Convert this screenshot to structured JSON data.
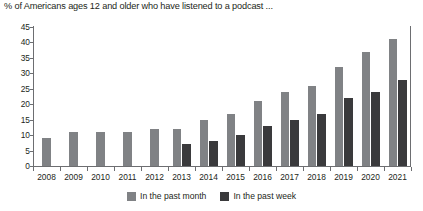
{
  "chart_data": {
    "type": "bar",
    "title": "% of Americans ages 12 and older who have listened to a podcast ...",
    "xlabel": "",
    "ylabel": "",
    "ylim": [
      0,
      45
    ],
    "ytick_step": 5,
    "yticks": [
      0,
      5,
      10,
      15,
      20,
      25,
      30,
      35,
      40,
      45
    ],
    "grid": false,
    "legend_position": "bottom-center",
    "categories": [
      "2008",
      "2009",
      "2010",
      "2011",
      "2012",
      "2013",
      "2014",
      "2015",
      "2016",
      "2017",
      "2018",
      "2019",
      "2020",
      "2021"
    ],
    "series": [
      {
        "name": "In the past month",
        "color": "#808285",
        "values": [
          9,
          11,
          11,
          11,
          12,
          12,
          15,
          17,
          21,
          24,
          26,
          32,
          37,
          41
        ]
      },
      {
        "name": "In the past week",
        "color": "#3a3a3c",
        "values": [
          null,
          null,
          null,
          null,
          null,
          7,
          8,
          10,
          13,
          15,
          17,
          22,
          24,
          28
        ]
      }
    ]
  },
  "legend": {
    "items": [
      {
        "label": "In the past month",
        "color": "#808285"
      },
      {
        "label": "In the past week",
        "color": "#3a3a3c"
      }
    ]
  }
}
